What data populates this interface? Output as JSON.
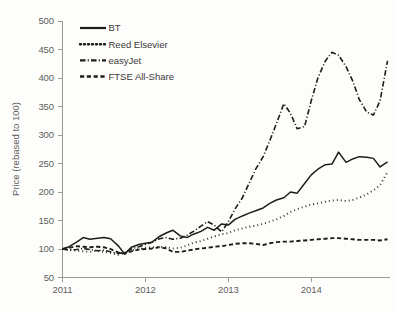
{
  "chart_data": {
    "type": "line",
    "title": "",
    "subtitle": "",
    "xlabel": "",
    "ylabel": "Price (rebased to 100)",
    "xlim": [
      2011.0,
      2014.95
    ],
    "ylim": [
      50,
      500
    ],
    "ytick_labels": [
      "500",
      "450",
      "400",
      "350",
      "300",
      "250",
      "200",
      "150",
      "100",
      "50"
    ],
    "ytick_values": [
      500,
      450,
      400,
      350,
      300,
      250,
      200,
      150,
      100,
      50
    ],
    "xtick_labels": [
      "2011",
      "2012",
      "2013",
      "2014"
    ],
    "xtick_values": [
      2011,
      2012,
      2013,
      2014
    ],
    "grid": false,
    "legend_position": "top-left",
    "legend": [
      {
        "name": "BT",
        "style": "solid"
      },
      {
        "name": "Reed Elsevier",
        "style": "dotted"
      },
      {
        "name": "easyJet",
        "style": "dash-dot"
      },
      {
        "name": "FTSE All-Share",
        "style": "dashed"
      }
    ],
    "x": [
      2011.0,
      2011.08,
      2011.17,
      2011.25,
      2011.33,
      2011.42,
      2011.5,
      2011.58,
      2011.67,
      2011.75,
      2011.83,
      2011.92,
      2012.0,
      2012.08,
      2012.17,
      2012.25,
      2012.33,
      2012.42,
      2012.5,
      2012.58,
      2012.67,
      2012.75,
      2012.83,
      2012.92,
      2013.0,
      2013.08,
      2013.17,
      2013.25,
      2013.33,
      2013.42,
      2013.5,
      2013.58,
      2013.67,
      2013.75,
      2013.83,
      2013.92,
      2014.0,
      2014.08,
      2014.17,
      2014.25,
      2014.33,
      2014.42,
      2014.5,
      2014.58,
      2014.67,
      2014.75,
      2014.83,
      2014.92
    ],
    "series": [
      {
        "name": "BT",
        "style": "solid",
        "values": [
          100,
          104,
          112,
          120,
          117,
          119,
          120,
          118,
          106,
          91,
          103,
          108,
          110,
          112,
          122,
          128,
          133,
          123,
          120,
          126,
          131,
          138,
          133,
          144,
          142,
          152,
          158,
          163,
          167,
          172,
          180,
          186,
          190,
          200,
          198,
          215,
          230,
          240,
          248,
          249,
          270,
          252,
          258,
          262,
          261,
          259,
          244,
          253
        ]
      },
      {
        "name": "Reed Elsevier",
        "style": "dotted",
        "values": [
          100,
          99,
          97,
          96,
          95,
          97,
          95,
          93,
          90,
          93,
          97,
          100,
          102,
          103,
          104,
          103,
          101,
          102,
          106,
          111,
          114,
          118,
          122,
          126,
          128,
          133,
          136,
          139,
          141,
          144,
          148,
          152,
          158,
          165,
          170,
          174,
          178,
          180,
          183,
          185,
          186,
          184,
          186,
          190,
          196,
          203,
          212,
          235
        ]
      },
      {
        "name": "easyJet",
        "style": "dash-dot",
        "values": [
          100,
          98,
          99,
          101,
          99,
          97,
          98,
          95,
          92,
          94,
          100,
          104,
          108,
          112,
          118,
          120,
          117,
          119,
          124,
          131,
          140,
          148,
          142,
          130,
          148,
          170,
          190,
          215,
          240,
          262,
          290,
          320,
          355,
          338,
          311,
          315,
          360,
          400,
          430,
          445,
          440,
          420,
          395,
          362,
          340,
          335,
          360,
          430
        ]
      },
      {
        "name": "FTSE All-Share",
        "style": "dashed",
        "values": [
          100,
          102,
          105,
          104,
          103,
          104,
          103,
          100,
          94,
          92,
          96,
          99,
          100,
          101,
          103,
          101,
          95,
          95,
          97,
          99,
          101,
          102,
          104,
          105,
          107,
          109,
          110,
          110,
          109,
          107,
          110,
          112,
          113,
          113,
          114,
          115,
          116,
          117,
          118,
          119,
          119,
          118,
          117,
          116,
          116,
          116,
          115,
          117
        ]
      }
    ]
  },
  "colors": {
    "ink": "#1d1d1b",
    "axis": "#9a9a96",
    "text": "#5d5d5b",
    "background": "#fdfdfc"
  }
}
